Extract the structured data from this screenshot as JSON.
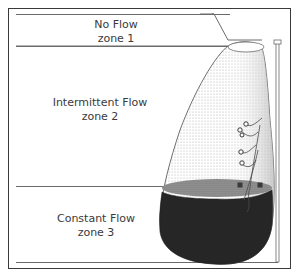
{
  "diagram": {
    "title": "",
    "zones": [
      {
        "name": "No Flow",
        "zone": "zone 1"
      },
      {
        "name": "Intermittent Flow",
        "zone": "zone 2"
      },
      {
        "name": "Constant Flow",
        "zone": "zone 3"
      }
    ],
    "colors": {
      "outline": "#3a3a3a",
      "fluid": "#2a2a2a",
      "stipple": "#c8c8c8"
    }
  }
}
